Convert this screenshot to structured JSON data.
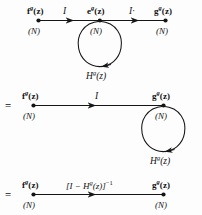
{
  "diagram": {
    "stroke_color": "#151515",
    "background_color": "#fdfdfd",
    "equals_sign": "=",
    "rows": [
      {
        "id": "row-1-original",
        "nodes": [
          {
            "id": "f",
            "base": "f",
            "sup": "g",
            "arg": "(z)",
            "dim": "(N)"
          },
          {
            "id": "e",
            "base": "e",
            "sup": "g",
            "arg": "(z)",
            "dim": "(N)"
          },
          {
            "id": "g",
            "base": "g",
            "sup": "g",
            "arg": "(z)",
            "dim": "(N)"
          }
        ],
        "edges": [
          {
            "id": "f-to-e",
            "label": "I"
          },
          {
            "id": "e-to-g",
            "label": "I·"
          }
        ],
        "loop": {
          "id": "e-self-loop",
          "base": "H",
          "sup": "g",
          "arg": "(z)"
        }
      },
      {
        "id": "row-2-merged",
        "nodes": [
          {
            "id": "f",
            "base": "f",
            "sup": "g",
            "arg": "(z)",
            "dim": "(N)"
          },
          {
            "id": "g",
            "base": "g",
            "sup": "g",
            "arg": "(z)",
            "dim": "(N)"
          }
        ],
        "edges": [
          {
            "id": "f-to-g",
            "label": "I"
          }
        ],
        "loop": {
          "id": "g-self-loop",
          "base": "H",
          "sup": "g",
          "arg": "(z)"
        }
      },
      {
        "id": "row-3-solved",
        "nodes": [
          {
            "id": "f",
            "base": "f",
            "sup": "g",
            "arg": "(z)",
            "dim": "(N)"
          },
          {
            "id": "g",
            "base": "g",
            "sup": "g",
            "arg": "(z)",
            "dim": "(N)"
          }
        ],
        "edges": [
          {
            "id": "f-to-g-inverse",
            "prefix": "[I − H",
            "sup": "g",
            "middle": "(z)]",
            "exponent": "−1"
          }
        ],
        "loop": null
      }
    ]
  }
}
